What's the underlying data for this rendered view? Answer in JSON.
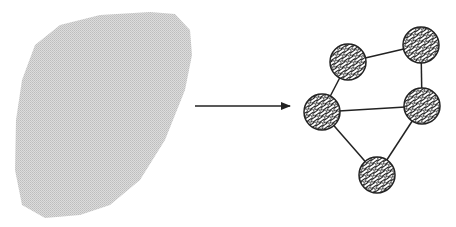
{
  "diagram": {
    "blob": {
      "fill": "#d4d4d4",
      "path": "M150,12 L175,14 L190,30 L192,55 L185,90 L165,140 L140,180 L110,205 L80,215 L45,218 L22,205 L15,170 L16,120 L22,80 L35,45 L60,25 L100,15 Z"
    },
    "arrow": {
      "x1": 195,
      "y1": 106,
      "x2": 290,
      "y2": 106,
      "color": "#222222"
    },
    "graph": {
      "node_radius": 18,
      "nodes": [
        {
          "id": "A",
          "x": 348,
          "y": 62
        },
        {
          "id": "B",
          "x": 421,
          "y": 45
        },
        {
          "id": "C",
          "x": 322,
          "y": 112
        },
        {
          "id": "D",
          "x": 422,
          "y": 106
        },
        {
          "id": "E",
          "x": 377,
          "y": 175
        }
      ],
      "edges": [
        [
          "A",
          "B"
        ],
        [
          "B",
          "D"
        ],
        [
          "A",
          "C"
        ],
        [
          "C",
          "D"
        ],
        [
          "C",
          "E"
        ],
        [
          "D",
          "E"
        ]
      ],
      "stroke": "#222222"
    }
  }
}
